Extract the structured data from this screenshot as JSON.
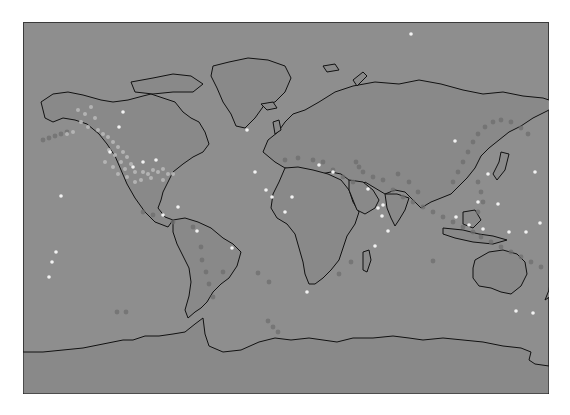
{
  "map": {
    "projection": "equirectangular",
    "frame": {
      "x": 23,
      "y": 22,
      "width": 526,
      "height": 372
    },
    "colors": {
      "ocean": "#8e8e8e",
      "land": "#898989",
      "coastline": "#111111",
      "frame_border": "#3a3a3a",
      "point_bright": "#f2f2f2",
      "point_light": "#b8b8b8",
      "point_dark": "#6e6e6e"
    },
    "points": {
      "bright": [
        [
          388,
          12
        ],
        [
          224,
          108
        ],
        [
          232,
          150
        ],
        [
          243,
          168
        ],
        [
          296,
          143
        ],
        [
          310,
          150
        ],
        [
          345,
          167
        ],
        [
          355,
          186
        ],
        [
          360,
          183
        ],
        [
          359,
          194
        ],
        [
          365,
          209
        ],
        [
          352,
          224
        ],
        [
          249,
          175
        ],
        [
          262,
          190
        ],
        [
          269,
          175
        ],
        [
          284,
          270
        ],
        [
          209,
          226
        ],
        [
          110,
          145
        ],
        [
          133,
          138
        ],
        [
          432,
          119
        ],
        [
          433,
          195
        ],
        [
          455,
          180
        ],
        [
          460,
          207
        ],
        [
          475,
          182
        ],
        [
          493,
          289
        ],
        [
          510,
          291
        ],
        [
          140,
          193
        ],
        [
          38,
          174
        ],
        [
          155,
          185
        ],
        [
          174,
          209
        ],
        [
          512,
          150
        ],
        [
          465,
          152
        ],
        [
          486,
          210
        ],
        [
          503,
          210
        ],
        [
          517,
          201
        ],
        [
          446,
          203
        ],
        [
          33,
          230
        ],
        [
          26,
          255
        ],
        [
          29,
          240
        ],
        [
          96,
          105
        ],
        [
          100,
          90
        ],
        [
          120,
          140
        ],
        [
          87,
          130
        ]
      ],
      "light": [
        [
          55,
          88
        ],
        [
          62,
          92
        ],
        [
          68,
          85
        ],
        [
          72,
          96
        ],
        [
          58,
          100
        ],
        [
          65,
          105
        ],
        [
          75,
          108
        ],
        [
          50,
          110
        ],
        [
          80,
          112
        ],
        [
          85,
          115
        ],
        [
          44,
          112
        ],
        [
          90,
          120
        ],
        [
          95,
          125
        ],
        [
          86,
          128
        ],
        [
          100,
          130
        ],
        [
          92,
          133
        ],
        [
          104,
          135
        ],
        [
          98,
          140
        ],
        [
          108,
          142
        ],
        [
          90,
          145
        ],
        [
          102,
          147
        ],
        [
          112,
          150
        ],
        [
          120,
          150
        ],
        [
          125,
          152
        ],
        [
          130,
          148
        ],
        [
          135,
          150
        ],
        [
          140,
          147
        ],
        [
          145,
          152
        ],
        [
          118,
          158
        ],
        [
          112,
          160
        ],
        [
          128,
          156
        ],
        [
          104,
          155
        ],
        [
          95,
          152
        ],
        [
          82,
          140
        ],
        [
          140,
          158
        ],
        [
          150,
          152
        ]
      ],
      "dark": [
        [
          20,
          118
        ],
        [
          26,
          116
        ],
        [
          32,
          114
        ],
        [
          38,
          112
        ],
        [
          44,
          110
        ],
        [
          120,
          190
        ],
        [
          130,
          193
        ],
        [
          150,
          200
        ],
        [
          170,
          205
        ],
        [
          178,
          225
        ],
        [
          179,
          238
        ],
        [
          183,
          250
        ],
        [
          186,
          262
        ],
        [
          190,
          275
        ],
        [
          262,
          138
        ],
        [
          275,
          136
        ],
        [
          290,
          138
        ],
        [
          300,
          140
        ],
        [
          310,
          148
        ],
        [
          320,
          155
        ],
        [
          330,
          160
        ],
        [
          340,
          150
        ],
        [
          350,
          155
        ],
        [
          360,
          158
        ],
        [
          370,
          168
        ],
        [
          380,
          175
        ],
        [
          390,
          180
        ],
        [
          400,
          185
        ],
        [
          410,
          190
        ],
        [
          420,
          195
        ],
        [
          430,
          200
        ],
        [
          440,
          205
        ],
        [
          450,
          210
        ],
        [
          458,
          215
        ],
        [
          468,
          220
        ],
        [
          478,
          225
        ],
        [
          488,
          230
        ],
        [
          498,
          235
        ],
        [
          508,
          240
        ],
        [
          518,
          245
        ],
        [
          430,
          160
        ],
        [
          435,
          150
        ],
        [
          440,
          140
        ],
        [
          445,
          130
        ],
        [
          450,
          120
        ],
        [
          455,
          112
        ],
        [
          462,
          105
        ],
        [
          470,
          100
        ],
        [
          478,
          98
        ],
        [
          488,
          100
        ],
        [
          498,
          106
        ],
        [
          505,
          112
        ],
        [
          455,
          160
        ],
        [
          458,
          170
        ],
        [
          460,
          180
        ],
        [
          455,
          190
        ],
        [
          333,
          140
        ],
        [
          336,
          145
        ],
        [
          395,
          170
        ],
        [
          386,
          160
        ],
        [
          375,
          152
        ],
        [
          246,
          260
        ],
        [
          200,
          250
        ],
        [
          94,
          290
        ],
        [
          103,
          290
        ],
        [
          245,
          299
        ],
        [
          250,
          305
        ],
        [
          255,
          310
        ],
        [
          328,
          240
        ],
        [
          316,
          252
        ],
        [
          410,
          239
        ],
        [
          235,
          251
        ]
      ]
    },
    "landmasses": [
      {
        "name": "north-america",
        "d": "M18 80 L30 72 L45 70 L60 73 L78 78 L90 80 L105 78 L120 74 L128 72 L140 76 L152 80 L160 90 L168 96 L176 100 L182 110 L186 122 L180 130 L170 135 L160 142 L150 150 L145 160 L140 170 L138 178 L135 186 L142 195 L150 198 L145 205 L132 200 L122 190 L112 176 L104 162 L98 148 L92 134 L84 122 L76 112 L64 102 L52 98 L40 96 L30 100 L22 96 Z"
      },
      {
        "name": "greenland",
        "d": "M190 44 L206 40 L225 36 L245 38 L262 44 L268 56 L262 70 L252 80 L242 82 L232 96 L222 106 L213 104 L208 92 L200 80 L194 66 L188 54 Z"
      },
      {
        "name": "south-america",
        "d": "M150 198 L162 196 L175 200 L188 206 L200 216 L210 222 L218 230 L214 244 L206 256 L198 262 L190 270 L184 280 L178 286 L172 290 L165 296 L162 288 L166 274 L168 260 L166 246 L160 234 L154 222 L150 210 Z"
      },
      {
        "name": "europe-asia",
        "d": "M240 130 L245 118 L255 110 L262 100 L270 92 L282 88 L296 80 L312 70 L330 64 L352 60 L376 62 L396 58 L418 62 L440 68 L460 72 L480 70 L500 74 L520 76 L532 80 L526 88 L510 96 L498 104 L486 110 L476 118 L466 126 L458 134 L452 146 L444 156 L436 164 L428 172 L418 176 L408 180 L398 186 L388 176 L382 170 L372 168 L362 172 L352 166 L342 160 L334 168 L326 158 L318 152 L308 150 L298 152 L290 150 L282 150 L272 148 L262 146 L252 140 Z"
      },
      {
        "name": "africa",
        "d": "M262 146 L275 145 L290 148 L305 152 L318 158 L326 168 L330 180 L336 190 L332 202 L324 214 L320 226 L316 238 L308 248 L300 256 L292 262 L286 262 L282 252 L280 240 L276 226 L272 212 L264 202 L254 196 L248 186 L250 172 L256 160 Z"
      },
      {
        "name": "arabia",
        "d": "M326 158 L340 160 L350 168 L356 178 L352 186 L342 192 L334 188 L330 178 L326 168 Z"
      },
      {
        "name": "india",
        "d": "M362 172 L374 172 L386 176 L382 188 L376 198 L372 204 L368 196 L364 186 Z"
      },
      {
        "name": "australia",
        "d": "M452 238 L466 230 L480 228 L494 232 L502 240 L504 252 L498 264 L488 272 L478 270 L468 266 L456 264 L450 256 L450 246 Z"
      },
      {
        "name": "madagascar",
        "d": "M340 230 L346 228 L348 238 L344 250 L340 248 Z"
      },
      {
        "name": "new-zealand",
        "d": "M528 254 L534 262 L528 274 L522 278 L526 268 Z"
      },
      {
        "name": "japan",
        "d": "M478 130 L486 132 L482 148 L474 158 L470 152 L476 140 Z"
      },
      {
        "name": "indonesia",
        "d": "M420 206 L440 208 L456 212 L470 214 L484 218 L470 222 L450 220 L432 216 L420 212 Z"
      },
      {
        "name": "borneo",
        "d": "M440 190 L452 188 L458 198 L450 206 L440 202 Z"
      },
      {
        "name": "uk",
        "d": "M250 100 L256 98 L258 108 L252 112 Z"
      },
      {
        "name": "iceland",
        "d": "M238 82 L250 80 L254 86 L244 88 Z"
      },
      {
        "name": "svalbard",
        "d": "M300 44 L312 42 L316 48 L304 50 Z"
      },
      {
        "name": "novaya-zemlya",
        "d": "M330 58 L340 50 L344 54 L334 64 Z"
      },
      {
        "name": "arctic-islands",
        "d": "M108 60 L130 56 L150 52 L168 54 L180 62 L170 70 L150 70 L130 72 L112 70 Z"
      },
      {
        "name": "antarctica",
        "d": "M0 330 L20 330 L40 328 L60 326 L80 322 L100 318 L110 318 L122 314 L136 314 L150 312 L162 310 L172 302 L180 296 L182 312 L186 324 L200 330 L218 328 L236 320 L252 316 L268 318 L286 316 L300 318 L314 320 L330 316 L350 316 L370 314 L386 316 L400 318 L420 316 L440 318 L460 320 L480 324 L498 326 L508 330 L506 338 L512 342 L526 344 L526 372 L0 372 Z"
      }
    ]
  }
}
